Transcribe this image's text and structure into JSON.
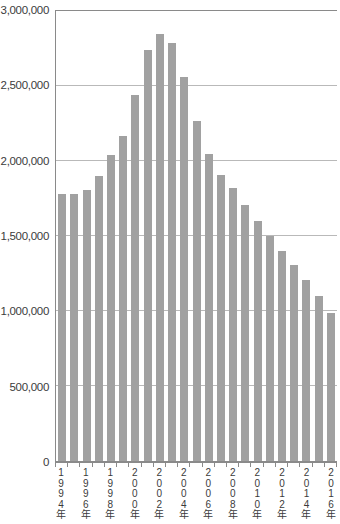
{
  "chart_data": {
    "type": "bar",
    "title": "",
    "xlabel": "",
    "ylabel": "",
    "categories": [
      1994,
      1995,
      1996,
      1997,
      1998,
      1999,
      2000,
      2001,
      2002,
      2003,
      2004,
      2005,
      2006,
      2007,
      2008,
      2009,
      2010,
      2011,
      2012,
      2013,
      2014,
      2015,
      2016
    ],
    "values": [
      1780000,
      1780000,
      1810000,
      1900000,
      2040000,
      2170000,
      2440000,
      2740000,
      2850000,
      2790000,
      2560000,
      2270000,
      2050000,
      1910000,
      1820000,
      1710000,
      1600000,
      1500000,
      1400000,
      1310000,
      1210000,
      1100000,
      990000
    ],
    "x_axis_labels": [
      "1994年",
      "1996年",
      "1998年",
      "2000年",
      "2002年",
      "2004年",
      "2006年",
      "2008年",
      "2010年",
      "2012年",
      "2014年",
      "2016年"
    ],
    "x_label_every": 2,
    "y_ticks": [
      0,
      500000,
      1000000,
      1500000,
      2000000,
      2500000,
      3000000
    ],
    "y_tick_labels": [
      "0",
      "500,000",
      "1,000,000",
      "1,500,000",
      "2,000,000",
      "2,500,000",
      "3,000,000"
    ],
    "ylim": [
      0,
      3000000
    ],
    "grid": "horizontal",
    "legend": "none",
    "colors": {
      "bar": "#a1a1a1",
      "axis": "#8a8a8a",
      "grid": "#b9b9b9",
      "text": "#3b3b3b"
    }
  }
}
